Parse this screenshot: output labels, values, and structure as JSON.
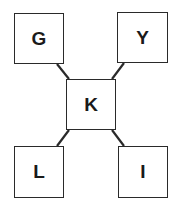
{
  "diagram": {
    "center": {
      "id": "K",
      "label": "K",
      "x": 66,
      "y": 79,
      "w": 50,
      "h": 51
    },
    "nodes": [
      {
        "id": "G",
        "label": "G",
        "x": 14,
        "y": 13,
        "w": 50,
        "h": 51
      },
      {
        "id": "Y",
        "label": "Y",
        "x": 117,
        "y": 12,
        "w": 51,
        "h": 51
      },
      {
        "id": "L",
        "label": "L",
        "x": 14,
        "y": 146,
        "w": 50,
        "h": 52
      },
      {
        "id": "I",
        "label": "I",
        "x": 118,
        "y": 146,
        "w": 50,
        "h": 52
      }
    ],
    "edges": [
      {
        "from": "G",
        "to": "K",
        "x1": 57,
        "y1": 64,
        "x2": 69,
        "y2": 79
      },
      {
        "from": "Y",
        "to": "K",
        "x1": 124,
        "y1": 63,
        "x2": 112,
        "y2": 79
      },
      {
        "from": "K",
        "to": "L",
        "x1": 69,
        "y1": 130,
        "x2": 57,
        "y2": 146
      },
      {
        "from": "K",
        "to": "I",
        "x1": 112,
        "y1": 130,
        "x2": 124,
        "y2": 146
      }
    ],
    "stroke_color": "#2a2a2a"
  }
}
